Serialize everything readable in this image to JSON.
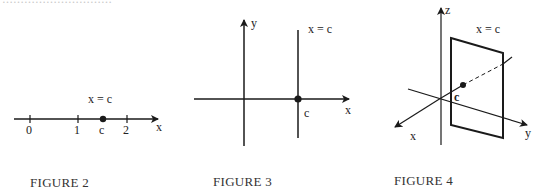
{
  "page": {
    "top_text_faint": "…………………………"
  },
  "figures": [
    {
      "id": "figure-2",
      "caption": "FIGURE 2",
      "description": "Number line with point x = c between 1 and 2",
      "equation_label": "x = c",
      "tick_labels": [
        "0",
        "1",
        "2"
      ],
      "point_label": "c",
      "axis_label": "x"
    },
    {
      "id": "figure-3",
      "caption": "FIGURE 3",
      "description": "xy-plane with vertical line x = c crossing the x-axis at c",
      "equation_label": "x = c",
      "point_label": "c",
      "axis_labels": {
        "x": "x",
        "y": "y"
      }
    },
    {
      "id": "figure-4",
      "caption": "FIGURE 4",
      "description": "3D coordinate system with the plane x = c perpendicular to the x-axis",
      "equation_label": "x = c",
      "point_label": "c",
      "axis_labels": {
        "x": "x",
        "y": "y",
        "z": "z"
      }
    }
  ],
  "colors": {
    "ink": "#1a1a1a",
    "background": "#ffffff"
  }
}
